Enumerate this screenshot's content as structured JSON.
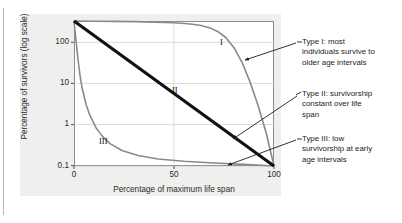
{
  "chart_data": {
    "type": "line",
    "title": "",
    "xlabel": "Percentage of maximum life span",
    "ylabel": "Percentage of survivors (log scale)",
    "yscale": "log",
    "xlim": [
      0,
      100
    ],
    "ylim": [
      0.1,
      100
    ],
    "xticks": [
      "0",
      "50",
      "100"
    ],
    "yticks": [
      "100",
      "10",
      "1",
      "0.1"
    ],
    "grid": true,
    "legend_position": "inline-labels",
    "series": [
      {
        "name": "I",
        "label": "I",
        "color": "#8a8a8a",
        "style": "curve",
        "x": [
          0,
          10,
          20,
          30,
          40,
          50,
          57,
          63,
          68,
          72,
          76,
          80,
          84,
          88,
          92,
          96,
          100
        ],
        "y": [
          100,
          99,
          98,
          97,
          95,
          92,
          88,
          82,
          72,
          60,
          45,
          28,
          14,
          5.5,
          1.8,
          0.5,
          0.1
        ]
      },
      {
        "name": "II",
        "label": "II",
        "color": "#111111",
        "style": "straight-line",
        "x": [
          0,
          25,
          50,
          75,
          100
        ],
        "y": [
          100,
          17.8,
          3.16,
          0.56,
          0.1
        ]
      },
      {
        "name": "III",
        "label": "III",
        "color": "#8a8a8a",
        "style": "curve",
        "x": [
          0,
          1,
          2,
          3,
          4,
          6,
          8,
          11,
          14,
          18,
          24,
          32,
          42,
          55,
          70,
          85,
          100
        ],
        "y": [
          100,
          40,
          16,
          7.5,
          4.2,
          1.9,
          1.1,
          0.62,
          0.42,
          0.29,
          0.21,
          0.165,
          0.14,
          0.125,
          0.115,
          0.108,
          0.1
        ]
      }
    ],
    "annotations": [
      {
        "id": "type-1",
        "lines": [
          "Type I: most",
          "individuals survive to",
          "older age intervals"
        ],
        "points_to": "type-i-curve"
      },
      {
        "id": "type-2",
        "lines": [
          "Type II: survivorship",
          "constant over life",
          "span"
        ],
        "points_to": "type-ii-line"
      },
      {
        "id": "type-3",
        "lines": [
          "Type III: low",
          "survivorship at early",
          "age intervals"
        ],
        "points_to": "type-iii-curve"
      }
    ],
    "colors": {
      "curve_gray": "#8a8a8a",
      "line_black": "#111111",
      "panel_background": "#efefed",
      "grid": "#d2d2d2",
      "frame": "#8d8d8d",
      "text": "#1c1c1c"
    }
  }
}
